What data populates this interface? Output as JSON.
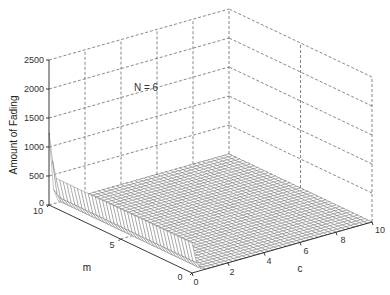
{
  "chart_data": {
    "type": "surface3d",
    "title": "",
    "annotation": "N = 6",
    "xlabel": "c",
    "ylabel": "m",
    "zlabel": "Amount of Fading",
    "x_ticks": [
      "0",
      "2",
      "4",
      "6",
      "8",
      "10"
    ],
    "y_ticks": [
      "0",
      "5",
      "10"
    ],
    "z_ticks": [
      "0",
      "500",
      "1000",
      "1500",
      "2000",
      "2500"
    ],
    "xlim": [
      0,
      10
    ],
    "ylim": [
      0,
      10
    ],
    "zlim": [
      0,
      2500
    ],
    "grid": true,
    "samples": [
      {
        "c": 0.1,
        "m": 10,
        "z": 1950
      },
      {
        "c": 0.1,
        "m": 7.5,
        "z": 760
      },
      {
        "c": 0.1,
        "m": 5,
        "z": 740
      },
      {
        "c": 0.1,
        "m": 2.5,
        "z": 720
      },
      {
        "c": 0.1,
        "m": 0.5,
        "z": 700
      },
      {
        "c": 1,
        "m": 5,
        "z": 20
      },
      {
        "c": 5,
        "m": 5,
        "z": 0
      },
      {
        "c": 10,
        "m": 10,
        "z": 0
      },
      {
        "c": 10,
        "m": 0,
        "z": 0
      }
    ]
  },
  "axes": {
    "z_label": "Amount of Fading",
    "x_label": "c",
    "y_label": "m",
    "annotation": "N = 6",
    "z_tick_labels": [
      "0",
      "500",
      "1000",
      "1500",
      "2000",
      "2500"
    ],
    "x_tick_labels": [
      "0",
      "2",
      "4",
      "6",
      "8",
      "10"
    ],
    "y_tick_labels": [
      "0",
      "5",
      "10"
    ]
  }
}
